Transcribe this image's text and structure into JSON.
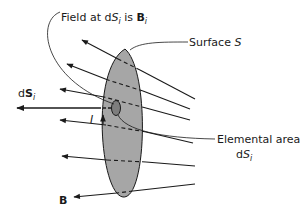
{
  "diagram": {
    "labels": {
      "field_at": {
        "prefix": "Field at d",
        "S": "S",
        "sub_i": "i",
        "is": " is ",
        "B": "B",
        "sub_i2": "i"
      },
      "surface": {
        "text": "Surface ",
        "symbol": "S"
      },
      "elemental_area": {
        "line1": "Elemental area",
        "d": "d",
        "S": "S",
        "sub_i": "i"
      },
      "dS_vector": {
        "d": "d",
        "S": "S",
        "sub_i": "i"
      },
      "current": "I",
      "field": "B"
    },
    "colors": {
      "surface_fill": "#a6a6a6",
      "line": "#1a1a1a",
      "element_fill": "#7d7d7d"
    },
    "field_lines_count": 7
  }
}
